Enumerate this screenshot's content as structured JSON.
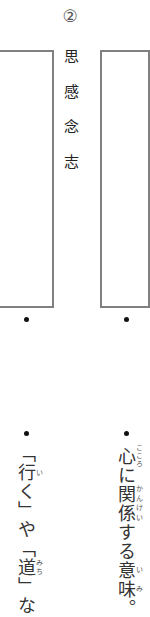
{
  "header": {
    "number_label": "②"
  },
  "kanji_list": [
    "思",
    "感",
    "念",
    "志"
  ],
  "notes": {
    "left": {
      "segments": [
        {
          "text": "「"
        },
        {
          "text": "行",
          "ruby": "い"
        },
        {
          "text": "く」や「"
        },
        {
          "text": "道",
          "ruby": "みち"
        },
        {
          "text": "」な"
        }
      ]
    },
    "right": {
      "segments": [
        {
          "text": "心",
          "ruby": "こころ"
        },
        {
          "text": "に"
        },
        {
          "text": "関係",
          "ruby": "かんけい"
        },
        {
          "text": "する"
        },
        {
          "text": "意味",
          "ruby": "いみ"
        },
        {
          "text": "。"
        }
      ]
    }
  },
  "colors": {
    "box_border": "#808080",
    "text": "#222222"
  }
}
